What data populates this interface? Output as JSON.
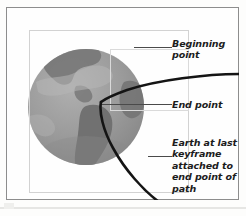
{
  "figure": {
    "type": "illustration",
    "callouts": [
      {
        "id": "beginning",
        "label": "Beginning\npoint"
      },
      {
        "id": "end",
        "label": "End point"
      },
      {
        "id": "earth",
        "label": "Earth at last\nkeyframe\nattached to\nend point of\npath"
      }
    ],
    "colors": {
      "page_background": "#fdfdfc",
      "frame_border": "#8d8d8d",
      "selection_box": "#d2d2d2",
      "path_stroke": "#111111",
      "leader_line": "#4a4a4a",
      "text": "#1c1c1c",
      "ocean": "#9a9a9a",
      "land": "#7b7b7b",
      "highlight": "#b9b9b9"
    },
    "path": {
      "description": "motion path curve crossing the globe",
      "begin_point": {
        "x": 246,
        "y": 73
      },
      "end_point": {
        "x": 100,
        "y": 101
      }
    }
  }
}
